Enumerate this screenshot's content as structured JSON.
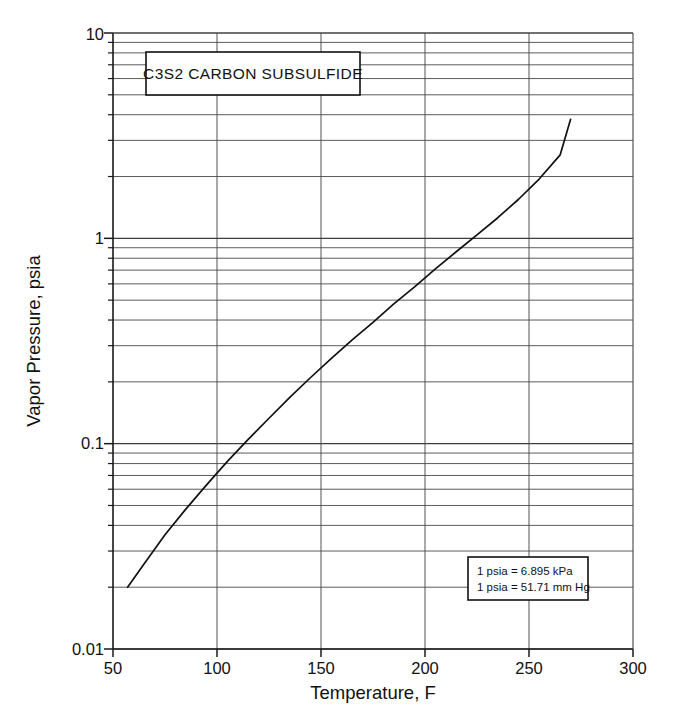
{
  "chart_data": {
    "type": "line",
    "title": "C3S2  CARBON SUBSULFIDE",
    "xlabel": "Temperature, F",
    "ylabel": "Vapor Pressure, psia",
    "xlim": [
      50,
      300
    ],
    "ylim": [
      0.01,
      10
    ],
    "yscale": "log",
    "xscale": "linear",
    "grid": true,
    "legend": "none",
    "x_ticks": [
      50,
      100,
      150,
      200,
      250,
      300
    ],
    "x_tick_labels": [
      "50",
      "100",
      "150",
      "200",
      "250",
      "300"
    ],
    "y_ticks": [
      0.01,
      0.1,
      1,
      10
    ],
    "y_tick_labels": [
      "0.01",
      "0.1",
      "1",
      "10"
    ],
    "y_minor_multipliers": [
      2,
      3,
      4,
      5,
      6,
      7,
      8,
      9
    ],
    "series": [
      {
        "name": "C3S2 vapor pressure",
        "x": [
          57,
          65,
          75,
          85,
          95,
          105,
          115,
          125,
          135,
          145,
          155,
          165,
          175,
          185,
          195,
          205,
          215,
          225,
          235,
          245,
          255,
          265,
          270
        ],
        "values": [
          0.02,
          0.026,
          0.036,
          0.048,
          0.063,
          0.082,
          0.105,
          0.133,
          0.168,
          0.21,
          0.26,
          0.32,
          0.39,
          0.48,
          0.58,
          0.71,
          0.86,
          1.04,
          1.26,
          1.55,
          1.95,
          2.55,
          3.8
        ]
      }
    ],
    "annotations": [
      {
        "name": "unit-conversion-note",
        "lines": [
          "1 psia = 6.895 kPa",
          "1 psia = 51.71 mm Hg"
        ]
      }
    ]
  },
  "labels": {
    "x_0": "50",
    "x_1": "100",
    "x_2": "150",
    "x_3": "200",
    "x_4": "250",
    "x_5": "300",
    "y_0": "0.01",
    "y_1": "0.1",
    "y_2": "1",
    "y_3": "10",
    "x_axis_title": "Temperature, F",
    "y_axis_title": "Vapor Pressure, psia",
    "chart_title": "C3S2  CARBON SUBSULFIDE",
    "note_line_1": "1 psia = 6.895 kPa",
    "note_line_2": "1 psia = 51.71 mm Hg"
  },
  "colors": {
    "curve": "#111111",
    "grid": "#4a4a4a",
    "axis": "#1a1a1a",
    "background": "#ffffff"
  }
}
